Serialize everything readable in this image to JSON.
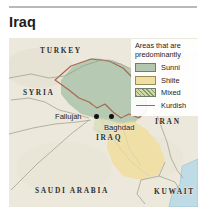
{
  "header": {
    "title": "Iraq"
  },
  "map": {
    "countries": [
      {
        "id": "turkey",
        "label": "TURKEY"
      },
      {
        "id": "syria",
        "label": "SYRIA"
      },
      {
        "id": "iran",
        "label": "IRAN"
      },
      {
        "id": "iraq",
        "label": "IRAQ"
      },
      {
        "id": "saudi-arabia",
        "label": "SAUDI ARABIA"
      },
      {
        "id": "kuwait",
        "label": "KUWAIT"
      }
    ],
    "cities": [
      {
        "id": "fallujah",
        "label": "Fallujah"
      },
      {
        "id": "baghdad",
        "label": "Baghdad"
      }
    ],
    "colors": {
      "base_land": "#ece9dc",
      "sunni": "#b3c7b0",
      "shiite": "#f0dfa4",
      "mixed": "#cfd9a8",
      "kurdish_line": "#a8664f",
      "water": "#bfdce6",
      "border": "#9a9a86"
    }
  },
  "legend": {
    "title": "Areas that are predominantly",
    "items": [
      {
        "id": "sunni",
        "label": "Sunni",
        "swatch": "sunni-swatch",
        "color": "#b3c7b0"
      },
      {
        "id": "shiite",
        "label": "Shiite",
        "swatch": "shiite-swatch",
        "color": "#f0dfa4"
      },
      {
        "id": "mixed",
        "label": "Mixed",
        "swatch": "mixed-swatch",
        "color": "#cfd9a8"
      },
      {
        "id": "kurdish",
        "label": "Kurdish",
        "swatch": "kurdish-line-swatch",
        "color": "#a8664f"
      }
    ]
  }
}
